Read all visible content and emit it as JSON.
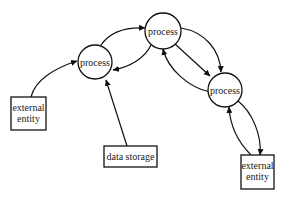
{
  "diagram": {
    "type": "data-flow-diagram",
    "nodes": [
      {
        "id": "p1",
        "kind": "process",
        "label": "process"
      },
      {
        "id": "p2",
        "kind": "process",
        "label": "process"
      },
      {
        "id": "p3",
        "kind": "process",
        "label": "process"
      },
      {
        "id": "e1",
        "kind": "external-entity",
        "label_line1": "external",
        "label_line2": "entity"
      },
      {
        "id": "ds",
        "kind": "data-store",
        "label": "data storage"
      },
      {
        "id": "e2",
        "kind": "external-entity",
        "label_line1": "external",
        "label_line2": "entity"
      }
    ],
    "edges": [
      {
        "from": "e1",
        "to": "p1"
      },
      {
        "from": "ds",
        "to": "p1"
      },
      {
        "from": "p1",
        "to": "p2"
      },
      {
        "from": "p2",
        "to": "p1"
      },
      {
        "from": "p2",
        "to": "p3",
        "route": "straight"
      },
      {
        "from": "p2",
        "to": "p3",
        "route": "arc-outer"
      },
      {
        "from": "p3",
        "to": "p2"
      },
      {
        "from": "p3",
        "to": "e2"
      },
      {
        "from": "e2",
        "to": "p3"
      }
    ]
  }
}
